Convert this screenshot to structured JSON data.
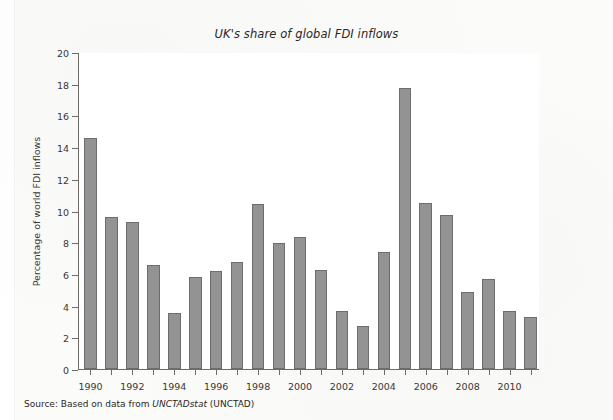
{
  "chart_data": {
    "type": "bar",
    "title": "UK's share of global FDI inflows",
    "xlabel": "",
    "ylabel": "Percentage of world FDI inflows",
    "ylim": [
      0,
      20
    ],
    "ytick_step": 2,
    "grid": false,
    "legend": null,
    "bar_color": "#939393",
    "bar_edge_color": "#6d6d6d",
    "categories": [
      "1990",
      "1991",
      "1992",
      "1993",
      "1994",
      "1995",
      "1996",
      "1997",
      "1998",
      "1999",
      "2000",
      "2001",
      "2002",
      "2003",
      "2004",
      "2005",
      "2006",
      "2007",
      "2008",
      "2009",
      "2010",
      "2011"
    ],
    "values": [
      14.6,
      9.6,
      9.25,
      6.55,
      3.55,
      5.8,
      6.2,
      6.75,
      10.4,
      7.95,
      8.35,
      6.25,
      3.65,
      2.7,
      7.4,
      17.75,
      10.45,
      9.7,
      4.85,
      5.7,
      3.65,
      3.3
    ],
    "xtick_labels": [
      "1990",
      "1992",
      "1994",
      "1996",
      "1998",
      "2000",
      "2002",
      "2004",
      "2006",
      "2008",
      "2010"
    ],
    "ytick_labels": [
      "0",
      "2",
      "4",
      "6",
      "8",
      "10",
      "12",
      "14",
      "16",
      "18",
      "20"
    ]
  },
  "source": {
    "prefix": "Source: Based on data from ",
    "italic": "UNCTADstat",
    "suffix": " (UNCTAD)"
  }
}
